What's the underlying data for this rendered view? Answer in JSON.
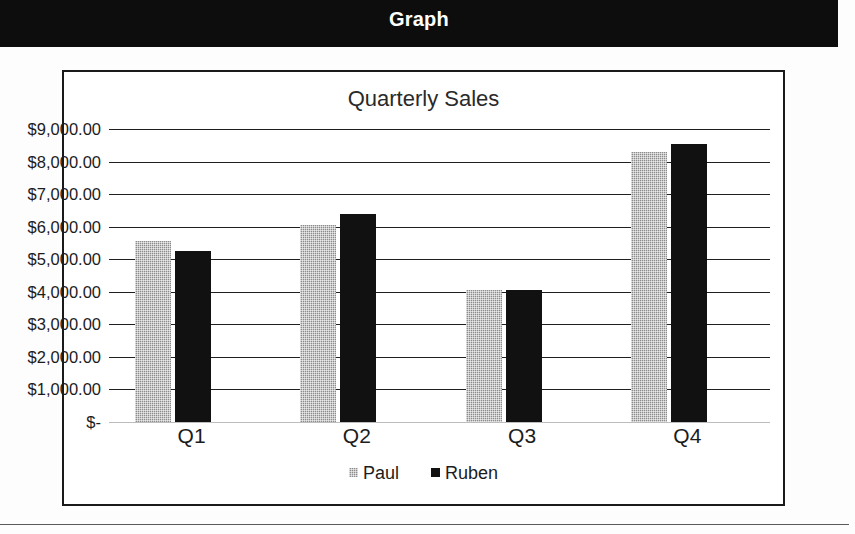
{
  "header": {
    "title": "Graph"
  },
  "chart_data": {
    "type": "bar",
    "title": "Quarterly Sales",
    "xlabel": "",
    "ylabel": "",
    "categories": [
      "Q1",
      "Q2",
      "Q3",
      "Q4"
    ],
    "series": [
      {
        "name": "Paul",
        "color": "#8c8c8c",
        "values": [
          5550,
          6050,
          4050,
          8300
        ]
      },
      {
        "name": "Ruben",
        "color": "#111111",
        "values": [
          5250,
          6400,
          4050,
          8550
        ]
      }
    ],
    "ylim": [
      0,
      9000
    ],
    "ytick_values": [
      9000,
      8000,
      7000,
      6000,
      5000,
      4000,
      3000,
      2000,
      1000,
      0
    ],
    "ytick_labels": [
      "$9,000.00",
      "$8,000.00",
      "$7,000.00",
      "$6,000.00",
      "$5,000.00",
      "$4,000.00",
      "$3,000.00",
      "$2,000.00",
      "$1,000.00",
      "$-"
    ],
    "grid": true,
    "legend_position": "bottom"
  }
}
